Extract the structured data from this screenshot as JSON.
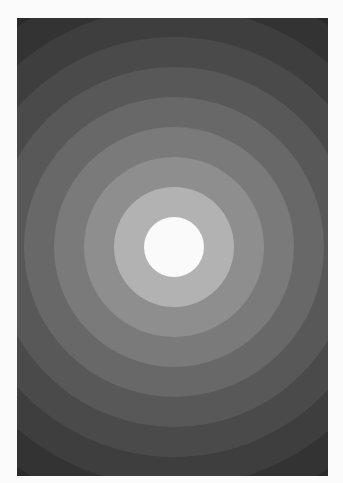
{
  "image": {
    "subject": "concentric grayscale circles",
    "background_color": "#fbfbfb",
    "panel": {
      "x": 17,
      "y": 18,
      "width": 311,
      "height": 458
    },
    "center": {
      "x": 157,
      "y": 229
    },
    "band_width": 30,
    "bands": [
      {
        "radius": 300,
        "color": "#2a2a2a"
      },
      {
        "radius": 270,
        "color": "#333333"
      },
      {
        "radius": 240,
        "color": "#3e3e3e"
      },
      {
        "radius": 210,
        "color": "#4a4a4a"
      },
      {
        "radius": 180,
        "color": "#585858"
      },
      {
        "radius": 150,
        "color": "#686868"
      },
      {
        "radius": 120,
        "color": "#7a7a7a"
      },
      {
        "radius": 90,
        "color": "#8e8e8e"
      },
      {
        "radius": 60,
        "color": "#a2a2a2"
      },
      {
        "radius": 30,
        "color": "#fafafa"
      }
    ],
    "inner_ring": {
      "radius": 60,
      "color": "#b2b2b2"
    }
  }
}
